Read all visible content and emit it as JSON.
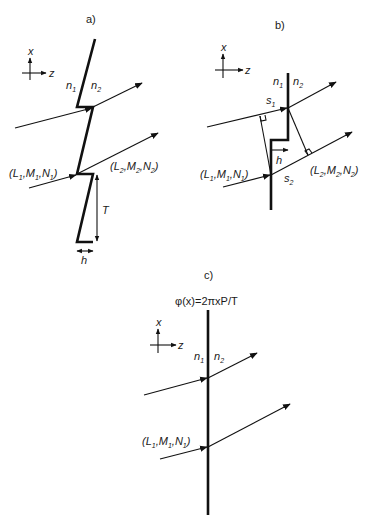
{
  "figure": {
    "panels": [
      {
        "id": "a",
        "label": "a)",
        "axis": {
          "x_label": "x",
          "z_label": "z"
        },
        "media": {
          "n1": {
            "base": "n",
            "sub": "1"
          },
          "n2": {
            "base": "n",
            "sub": "2"
          }
        },
        "incident": {
          "L": "L",
          "M": "M",
          "N": "N",
          "sub": "1"
        },
        "refracted": {
          "L": "L",
          "M": "M",
          "N": "N",
          "sub": "2"
        },
        "period_label": "T",
        "height_label": "h",
        "description": "Blazed (sawtooth) grating interface with incident and refracted rays"
      },
      {
        "id": "b",
        "label": "b)",
        "axis": {
          "x_label": "x",
          "z_label": "z"
        },
        "media": {
          "n1": {
            "base": "n",
            "sub": "1"
          },
          "n2": {
            "base": "n",
            "sub": "2"
          }
        },
        "incident": {
          "L": "L",
          "M": "M",
          "N": "N",
          "sub": "1"
        },
        "refracted": {
          "L": "L",
          "M": "M",
          "N": "N",
          "sub": "2"
        },
        "path_labels": [
          {
            "base": "s",
            "sub": "1"
          },
          {
            "base": "s",
            "sub": "2"
          }
        ],
        "height_label": "h",
        "description": "Single step of height h with optical path segments s1 and s2"
      },
      {
        "id": "c",
        "label": "c)",
        "axis": {
          "x_label": "x",
          "z_label": "z"
        },
        "phase_function": "φ(x)=2πxP/T",
        "media": {
          "n1": {
            "base": "n",
            "sub": "1"
          },
          "n2": {
            "base": "n",
            "sub": "2"
          }
        },
        "incident": {
          "L": "L",
          "M": "M",
          "N": "N",
          "sub": "1"
        },
        "description": "Equivalent thin phase surface with linear phase function"
      }
    ]
  }
}
